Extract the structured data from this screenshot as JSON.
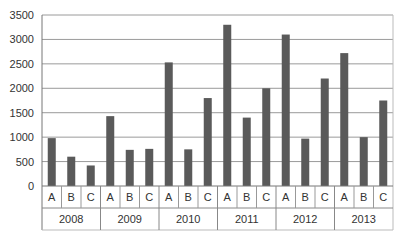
{
  "chart_data": {
    "type": "bar",
    "title": "",
    "xlabel": "",
    "ylabel": "",
    "ylim": [
      0,
      3500
    ],
    "yticks": [
      0,
      500,
      1000,
      1500,
      2000,
      2500,
      3000,
      3500
    ],
    "grid": true,
    "legend": null,
    "groups": [
      "2008",
      "2009",
      "2010",
      "2011",
      "2012",
      "2013"
    ],
    "subcategories": [
      "A",
      "B",
      "C"
    ],
    "values": [
      [
        980,
        600,
        420
      ],
      [
        1430,
        740,
        760
      ],
      [
        2530,
        750,
        1800
      ],
      [
        3300,
        1400,
        2000
      ],
      [
        3100,
        970,
        2200
      ],
      [
        2720,
        1000,
        1750
      ]
    ],
    "bar_color": "#5a5a5a",
    "grid_color": "#9a9a9a"
  }
}
